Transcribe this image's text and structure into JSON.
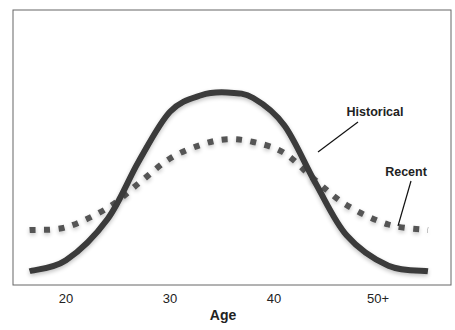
{
  "chart_data": {
    "type": "line",
    "title": "",
    "xlabel": "Age",
    "ylabel": "",
    "x_ticks": [
      {
        "value": 20,
        "label": "20"
      },
      {
        "value": 30,
        "label": "30"
      },
      {
        "value": 40,
        "label": "40"
      },
      {
        "value": 50,
        "label": "50+"
      }
    ],
    "xlim": [
      15,
      57
    ],
    "ylim": [
      0,
      100
    ],
    "grid": false,
    "legend": "inline annotations",
    "series": [
      {
        "name": "Historical",
        "style": "solid",
        "color": "#3a3a3a",
        "x": [
          16.5,
          20,
          24,
          27,
          30,
          33,
          35.5,
          38,
          41,
          44,
          47,
          51,
          54.8
        ],
        "values": [
          5,
          9,
          24,
          45,
          63,
          69,
          70,
          68,
          58,
          37,
          18,
          7,
          5
        ]
      },
      {
        "name": "Recent",
        "style": "dotted",
        "color": "#555555",
        "x": [
          16.5,
          20,
          24,
          27,
          30,
          33,
          35.5,
          38,
          41,
          44,
          47,
          51,
          54.8
        ],
        "values": [
          20,
          21,
          28,
          37,
          46,
          51,
          53,
          52,
          48,
          38,
          29,
          22,
          20
        ]
      }
    ],
    "annotations": [
      {
        "text": "Historical",
        "points_to": "Historical",
        "at_x": 43.5
      },
      {
        "text": "Recent",
        "points_to": "Recent",
        "at_x": 52
      }
    ]
  }
}
